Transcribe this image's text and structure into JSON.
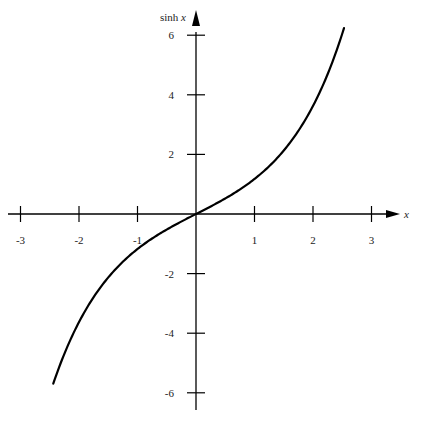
{
  "chart_data": {
    "type": "line",
    "title": "",
    "xlabel": "x",
    "ylabel": "sinh x",
    "ylabel_parts": {
      "func": "sinh",
      "var": "x"
    },
    "xlim": [
      -3.2,
      3.5
    ],
    "ylim": [
      -6.6,
      6.4
    ],
    "grid": false,
    "legend": null,
    "x_ticks": [
      -3,
      -2,
      -1,
      1,
      2,
      3
    ],
    "x_tick_labels": [
      "-3",
      "-2",
      "-1",
      "1",
      "2",
      "3"
    ],
    "y_ticks": [
      6,
      4,
      2,
      -2,
      -4,
      -6
    ],
    "y_tick_labels": [
      "6",
      "4",
      "2",
      "-2",
      "-4",
      "-6"
    ],
    "series": [
      {
        "name": "sinh x",
        "function": "sinh",
        "x_range": [
          -2.44,
          2.53
        ],
        "x": [
          -2.44,
          -2.0,
          -1.5,
          -1.0,
          -0.5,
          0,
          0.5,
          1.0,
          1.5,
          2.0,
          2.53
        ],
        "y": [
          -5.69,
          -3.63,
          -2.13,
          -1.18,
          -0.52,
          0,
          0.52,
          1.18,
          2.13,
          3.63,
          6.24
        ],
        "color": "#000000"
      }
    ]
  },
  "layout": {
    "origin_px": [
      196,
      214
    ],
    "x_unit_px": 58.5,
    "y_unit_px": 29.8,
    "x_axis_px": [
      8,
      400
    ],
    "y_axis_px": [
      410,
      24
    ]
  }
}
